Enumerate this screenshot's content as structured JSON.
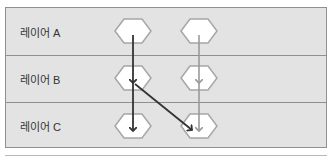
{
  "layers": [
    {
      "label": "레이어 A"
    },
    {
      "label": "레이어 B"
    },
    {
      "label": "레이어 C"
    }
  ],
  "colors": {
    "background": "#e3e3e3",
    "border": "#8f8f8f",
    "node_fill": "#ffffff",
    "node_stroke": "#a6a6a6",
    "arrow_dark": "#333333",
    "arrow_light": "#9a9a9a"
  },
  "nodes": [
    {
      "id": "A1",
      "layer": "A",
      "column": 1
    },
    {
      "id": "A2",
      "layer": "A",
      "column": 2
    },
    {
      "id": "B1",
      "layer": "B",
      "column": 1
    },
    {
      "id": "B2",
      "layer": "B",
      "column": 2
    },
    {
      "id": "C1",
      "layer": "C",
      "column": 1
    },
    {
      "id": "C2",
      "layer": "C",
      "column": 2
    }
  ],
  "edges": [
    {
      "from": "A1",
      "to": "B1",
      "style": "dark"
    },
    {
      "from": "B1",
      "to": "C1",
      "style": "dark"
    },
    {
      "from": "B1",
      "to": "C2",
      "style": "dark"
    },
    {
      "from": "A2",
      "to": "B2",
      "style": "light"
    },
    {
      "from": "B2",
      "to": "C2",
      "style": "light"
    }
  ]
}
